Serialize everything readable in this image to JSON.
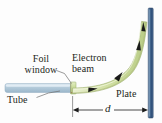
{
  "figure": {
    "background_color": "#fdfdfd",
    "labels": {
      "foil_window": "Foil\nwindow",
      "foil_window_line1": "Foil",
      "foil_window_line2": "window",
      "tube": "Tube",
      "electron_beam_line1": "Electron",
      "electron_beam_line2": "beam",
      "plate": "Plate",
      "distance": "d"
    },
    "colors": {
      "tube_fill": "#b9cede",
      "tube_edge": "#8fa9bd",
      "beam_fill": "#d7e3ac",
      "beam_edge": "#9aa86a",
      "foil_window_fill": "#cfe0a2",
      "plate_fill": "#3c5f86",
      "plate_edge": "#2b4462",
      "arrow_black": "#1a1a1a",
      "leader_line": "#6f6f6f",
      "dimension_line": "#1c1c1c",
      "text": "#231f20"
    },
    "geometry": {
      "tube_x_start": 5,
      "tube_x_end": 72,
      "tube_y_center": 88,
      "plate_x": 150,
      "plate_y_top": 8,
      "plate_y_bottom": 118,
      "beam_origin_x": 72,
      "beam_origin_y": 88,
      "beam_end_x": 146,
      "beam_end_y": 20,
      "dimension_y": 110,
      "dimension_x_start": 72,
      "dimension_x_end": 150,
      "beam_arrow_count": 3
    }
  }
}
